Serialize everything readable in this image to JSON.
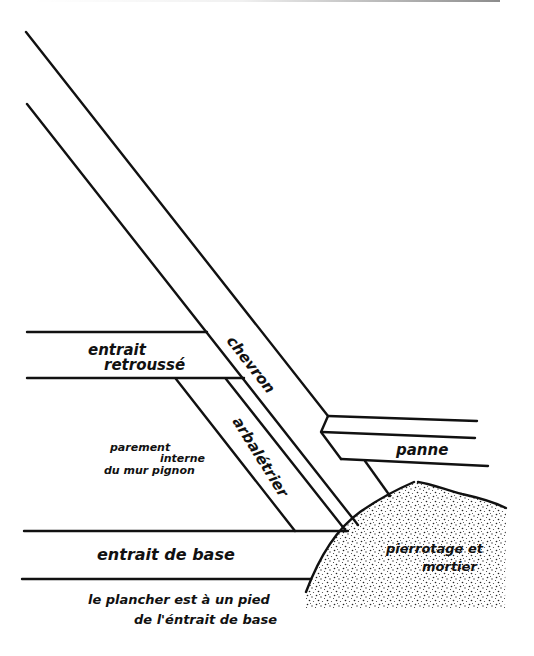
{
  "diagram": {
    "type": "roof-truss-cross-section",
    "labels": {
      "chevron": "chevron",
      "entrait_retrousse_1": "entrait",
      "entrait_retrousse_2": "retroussé",
      "arbaletrier": "arbalétrier",
      "panne": "panne",
      "parement_1": "parement",
      "parement_2": "interne",
      "parement_3": "du mur pignon",
      "entrait_de_base": "entrait de base",
      "pierrotage_1": "pierrotage et",
      "pierrotage_2": "mortier",
      "note_1": "le plancher est à un pied",
      "note_2": "de l'éntrait de base"
    },
    "colors": {
      "ink": "#111111",
      "background": "#ffffff"
    }
  }
}
